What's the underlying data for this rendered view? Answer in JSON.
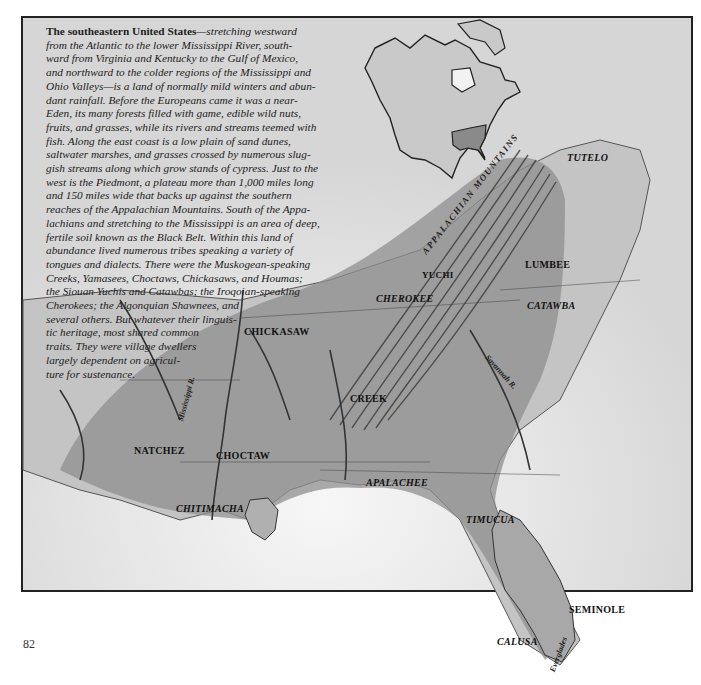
{
  "caption": {
    "lead": "The southeastern United States",
    "lines": [
      "—stretching westward",
      "from the Atlantic to the lower Mississippi River, south-",
      "ward from Virginia and Kentucky to the Gulf of Mexico,",
      "and northward to the colder regions of the Mississippi and",
      "Ohio Valleys—is a land of normally mild winters and abun-",
      "dant rainfall. Before the Europeans came it was a near-",
      "Eden, its many forests filled with game, edible wild nuts,",
      "fruits, and grasses, while its rivers and streams teemed with",
      "fish. Along the east coast is a low plain of sand dunes,",
      "saltwater marshes, and grasses crossed by numerous slug-",
      "gish streams along which grow stands of cypress. Just to the",
      "west is the Piedmont, a plateau more than 1,000 miles long",
      "and 150 miles wide that backs up against the southern",
      "reaches of the Appalachian Mountains. South of the Appa-",
      "lachians and stretching to the Mississippi is an area of deep,",
      "fertile soil known as the Black Belt. Within this land of",
      "abundance lived numerous tribes speaking a variety of",
      "tongues and dialects. There were the Muskogean-speaking",
      "Creeks, Yamasees, Choctaws, Chickasaws, and Houmas;",
      "the Siouan Yuchis and Catawbas; the Iroqoian-speaking",
      "Cherokees; the Algonquian Shawnees, and",
      "several others. But whatever their linguis-",
      "tic heritage, most shared common",
      "traits. They were village dwellers",
      "largely dependent on agricul-",
      "ture for sustenance."
    ]
  },
  "map": {
    "tribes": {
      "tutelo": "TUTELO",
      "yuchi": "YUCHI",
      "lumbee": "LUMBEE",
      "cherokee": "CHEROKEE",
      "catawba": "CATAWBA",
      "chickasaw": "CHICKASAW",
      "creek": "CREEK",
      "natchez": "NATCHEZ",
      "choctaw": "CHOCTAW",
      "apalachee": "APALACHEE",
      "chitimacha": "CHITIMACHA",
      "timucua": "TIMUCUA",
      "seminole": "SEMINOLE",
      "calusa": "CALUSA"
    },
    "features": {
      "mountains": "APPALACHIAN MOUNTAINS",
      "mississippi": "Mississippi R.",
      "savannah": "Savannah R.",
      "everglades": "Everglades"
    },
    "colors": {
      "region_shade": "#8c8c8c",
      "land": "#c8c8c8",
      "water": "#f0f0f0",
      "frame": "#222222"
    }
  },
  "page_number": "82"
}
